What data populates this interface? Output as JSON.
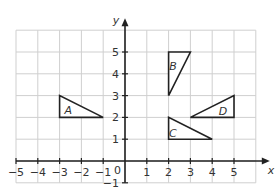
{
  "diagram": {
    "type": "coordinate-grid",
    "x_axis": {
      "label": "x",
      "min": -5,
      "max": 6,
      "ticks": [
        -5,
        -4,
        -3,
        -2,
        -1,
        1,
        2,
        3,
        4,
        5
      ],
      "origin_label": "0"
    },
    "y_axis": {
      "label": "y",
      "min": -1,
      "max": 6,
      "ticks": [
        -1,
        1,
        2,
        3,
        4,
        5
      ]
    },
    "shapes": [
      {
        "label": "A",
        "vertices": [
          [
            -3,
            2
          ],
          [
            -3,
            3
          ],
          [
            -1,
            2
          ]
        ],
        "label_pos": [
          -2.6,
          2.35
        ]
      },
      {
        "label": "B",
        "vertices": [
          [
            2,
            3
          ],
          [
            2,
            5
          ],
          [
            3,
            5
          ]
        ],
        "label_pos": [
          2.2,
          4.35
        ]
      },
      {
        "label": "C",
        "vertices": [
          [
            2,
            1
          ],
          [
            2,
            2
          ],
          [
            4,
            1
          ]
        ],
        "label_pos": [
          2.2,
          1.3
        ]
      },
      {
        "label": "D",
        "vertices": [
          [
            3,
            2
          ],
          [
            5,
            2
          ],
          [
            5,
            3
          ]
        ],
        "label_pos": [
          4.5,
          2.3
        ]
      }
    ]
  }
}
